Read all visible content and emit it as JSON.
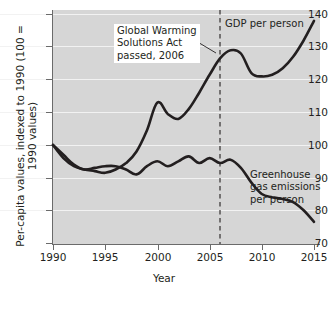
{
  "chart_data": {
    "type": "line",
    "title": "",
    "xlabel": "Year",
    "ylabel": "Per-capita values, indexed to 1990 (100 = 1990 values)",
    "xlim": [
      1990,
      2015.5
    ],
    "ylim": [
      70,
      140
    ],
    "yticks": [
      70,
      80,
      90,
      100,
      110,
      120,
      130,
      140
    ],
    "xticks": [
      1990,
      1995,
      2000,
      2005,
      2010,
      2015
    ],
    "grid": "horizontal",
    "legend_position": "inline-labels",
    "x": [
      1990,
      1991,
      1992,
      1993,
      1994,
      1995,
      1996,
      1997,
      1998,
      1999,
      2000,
      2001,
      2002,
      2003,
      2004,
      2005,
      2006,
      2007,
      2008,
      2009,
      2010,
      2011,
      2012,
      2013,
      2014,
      2015
    ],
    "series": [
      {
        "name": "GDP per person",
        "values": [
          100,
          96,
          93.5,
          92.5,
          92,
          91.5,
          92.5,
          94.5,
          98,
          104.5,
          113,
          109.5,
          108,
          111,
          116,
          121.5,
          126.5,
          129,
          128,
          122,
          121,
          121.5,
          123.5,
          127,
          132,
          138
        ]
      },
      {
        "name": "Greenhouse gas emissions per person",
        "values": [
          100,
          97,
          94,
          92.5,
          93,
          93.5,
          93.5,
          92.5,
          91,
          93.5,
          95,
          93.5,
          95,
          96.5,
          94.5,
          96,
          94.5,
          95.5,
          93,
          88.5,
          85,
          84,
          83.5,
          82.5,
          80,
          76.5
        ]
      }
    ],
    "annotations": [
      {
        "id": "event",
        "lines": [
          "Global Warming",
          "Solutions Act",
          "passed, 2006"
        ],
        "event_year": 2006,
        "marker": "dashed-vertical-line"
      }
    ],
    "series_labels": {
      "gdp": "GDP per person",
      "emissions_line1": "Greenhouse",
      "emissions_line2": "gas emissions",
      "emissions_line3": "per person"
    },
    "colors": {
      "plot_background": "#d6d6d6",
      "line": "#231f20",
      "gridline": "#f2f2f2",
      "axis": "#6b6b6b",
      "annotation_background": "#ffffff"
    }
  }
}
